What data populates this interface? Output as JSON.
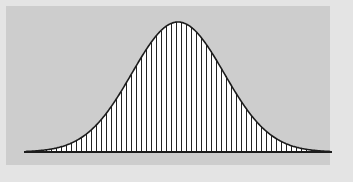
{
  "figure": {
    "width": 353,
    "height": 182,
    "background_color": "#cdcdcd",
    "margin_color": "#e4e4e4",
    "plot_area": {
      "x": 6,
      "y": 6,
      "width": 324,
      "height": 159
    }
  },
  "style": {
    "curve_color": "#1c1c1c",
    "curve_width": 1.6,
    "bar_color": "#232323",
    "bar_width": 1.0,
    "fill_color": "#ffffff",
    "axis_color": "#1c1c1c",
    "axis_width": 2.0
  },
  "geometry": {
    "baseline_y": 152,
    "axis_x_start": 26,
    "axis_x_end": 330,
    "peak_x": 178,
    "peak_y": 22,
    "peak_height": 130,
    "bar_spacing": 5,
    "sigma_px": 46
  },
  "chart_data": {
    "type": "bar",
    "title": "",
    "subtitle": "",
    "xlabel": "",
    "ylabel": "",
    "grid": false,
    "legend": null,
    "legend_position": "none",
    "annotations": [],
    "xticks": [],
    "yticks": [],
    "xlim": [
      -3.3,
      3.3
    ],
    "ylim": [
      0,
      1
    ],
    "distribution": "normal",
    "mean": 0,
    "std_dev": 1,
    "bin_count": 61,
    "x": [
      -3.3,
      -3.19,
      -3.08,
      -2.97,
      -2.86,
      -2.75,
      -2.64,
      -2.53,
      -2.42,
      -2.31,
      -2.2,
      -2.09,
      -1.98,
      -1.87,
      -1.76,
      -1.65,
      -1.54,
      -1.43,
      -1.32,
      -1.21,
      -1.1,
      -0.99,
      -0.88,
      -0.77,
      -0.66,
      -0.55,
      -0.44,
      -0.33,
      -0.22,
      -0.11,
      0.0,
      0.11,
      0.22,
      0.33,
      0.44,
      0.55,
      0.66,
      0.77,
      0.88,
      0.99,
      1.1,
      1.21,
      1.32,
      1.43,
      1.54,
      1.65,
      1.76,
      1.87,
      1.98,
      2.09,
      2.2,
      2.31,
      2.42,
      2.53,
      2.64,
      2.75,
      2.86,
      2.97,
      3.08,
      3.19,
      3.3
    ],
    "values": [
      0.004,
      0.006,
      0.009,
      0.013,
      0.018,
      0.024,
      0.031,
      0.041,
      0.053,
      0.068,
      0.087,
      0.11,
      0.139,
      0.174,
      0.215,
      0.263,
      0.308,
      0.36,
      0.418,
      0.481,
      0.546,
      0.613,
      0.679,
      0.743,
      0.803,
      0.859,
      0.907,
      0.947,
      0.976,
      0.994,
      1.0,
      0.994,
      0.976,
      0.947,
      0.907,
      0.859,
      0.803,
      0.743,
      0.679,
      0.613,
      0.546,
      0.481,
      0.418,
      0.36,
      0.308,
      0.263,
      0.215,
      0.174,
      0.139,
      0.11,
      0.087,
      0.068,
      0.053,
      0.041,
      0.031,
      0.024,
      0.018,
      0.013,
      0.009,
      0.006,
      0.004
    ],
    "curve_label": "normal-density-curve",
    "bars_label": "histogram-bars"
  }
}
